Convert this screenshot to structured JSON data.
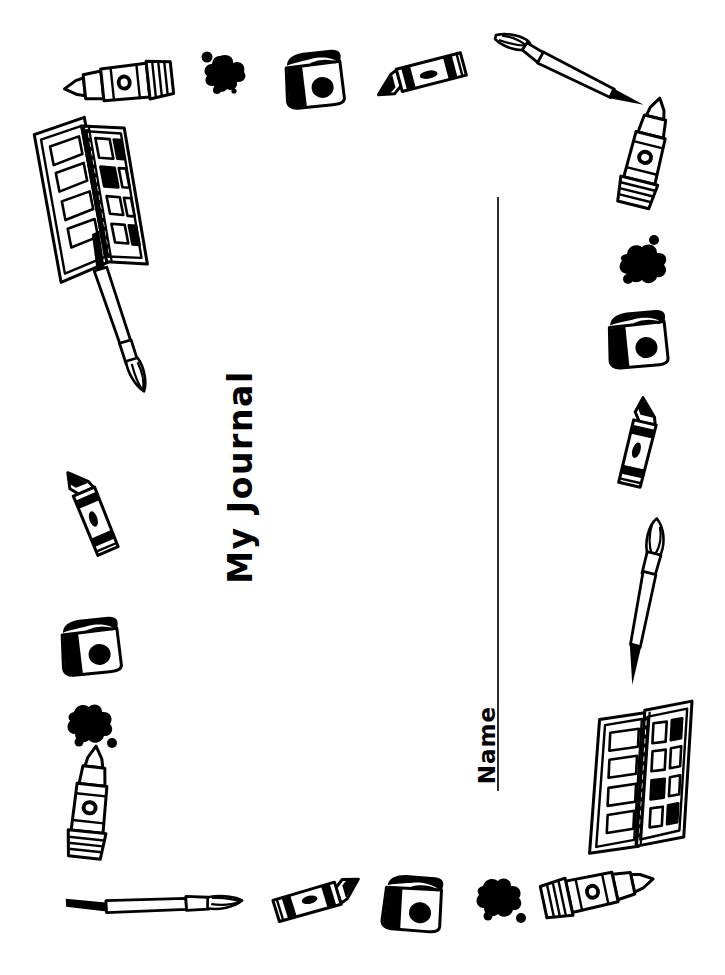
{
  "page": {
    "kind": "printable-worksheet",
    "background_color": "#ffffff",
    "ink_color": "#000000",
    "width": 725,
    "height": 975
  },
  "title": {
    "text": "My Journal",
    "orientation": "rotated-90-ccw",
    "color": "#000000"
  },
  "name_field": {
    "label": "Name",
    "orientation": "rotated-90-ccw",
    "rule_color": "#2b2b2b",
    "value": ""
  },
  "border_decorations": [
    {
      "id": "marker-top-left",
      "icon": "marker-icon",
      "region": "top",
      "angle": -6
    },
    {
      "id": "splat-top-left",
      "icon": "paint-splat-icon",
      "region": "top",
      "angle": 0
    },
    {
      "id": "paint-jar-top-center",
      "icon": "paint-jar-icon",
      "region": "top",
      "angle": -4
    },
    {
      "id": "crayon-top-center",
      "icon": "crayon-icon",
      "region": "top",
      "angle": -10
    },
    {
      "id": "paintbrush-top-right",
      "icon": "paintbrush-icon",
      "region": "top",
      "angle": 14
    },
    {
      "id": "palette-upper-left",
      "icon": "paint-palette-icon",
      "region": "left",
      "angle": -8
    },
    {
      "id": "paintbrush-left",
      "icon": "paintbrush-icon",
      "region": "left",
      "angle": 64
    },
    {
      "id": "crayon-left",
      "icon": "crayon-icon",
      "region": "left",
      "angle": 72
    },
    {
      "id": "paint-jar-left",
      "icon": "paint-jar-icon",
      "region": "left",
      "angle": -4
    },
    {
      "id": "splat-left",
      "icon": "paint-splat-icon",
      "region": "left",
      "angle": 0
    },
    {
      "id": "marker-left-lower",
      "icon": "marker-icon",
      "region": "left",
      "angle": 96
    },
    {
      "id": "paintbrush-bottom-left",
      "icon": "paintbrush-icon",
      "region": "bottom",
      "angle": -3
    },
    {
      "id": "crayon-bottom",
      "icon": "crayon-icon",
      "region": "bottom",
      "angle": -12
    },
    {
      "id": "paint-jar-bottom",
      "icon": "paint-jar-icon",
      "region": "bottom",
      "angle": 6
    },
    {
      "id": "splat-bottom",
      "icon": "paint-splat-icon",
      "region": "bottom",
      "angle": 0
    },
    {
      "id": "marker-bottom-right",
      "icon": "marker-icon",
      "region": "bottom",
      "angle": -12
    },
    {
      "id": "marker-right-upper",
      "icon": "marker-icon",
      "region": "right",
      "angle": 104
    },
    {
      "id": "splat-right",
      "icon": "paint-splat-icon",
      "region": "right",
      "angle": 0
    },
    {
      "id": "paint-jar-right",
      "icon": "paint-jar-icon",
      "region": "right",
      "angle": -3
    },
    {
      "id": "crayon-right",
      "icon": "crayon-icon",
      "region": "right",
      "angle": 108
    },
    {
      "id": "paintbrush-right",
      "icon": "paintbrush-icon",
      "region": "right",
      "angle": 96
    },
    {
      "id": "palette-lower-right",
      "icon": "paint-palette-icon",
      "region": "right",
      "angle": 6
    }
  ]
}
